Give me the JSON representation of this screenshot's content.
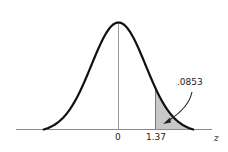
{
  "chart_data": {
    "type": "area",
    "title": "",
    "xlabel": "z",
    "ylabel": "",
    "x_ticks": [
      {
        "value": 0,
        "label": "0"
      },
      {
        "value": 1.37,
        "label": "1.37"
      }
    ],
    "shaded_region": {
      "from": 1.37,
      "to": "inf",
      "area": 0.0853,
      "label": ".0853"
    },
    "mean": 0,
    "std": 1,
    "grid": false,
    "legend": false,
    "colors": {
      "curve": "#111111",
      "shade": "#c8c8c8",
      "axis": "#8a8a8a",
      "mean_line": "#9a9a9a"
    }
  },
  "labels": {
    "zero": "0",
    "cutoff": "1.37",
    "axis_variable": "z",
    "area": ".0853"
  }
}
